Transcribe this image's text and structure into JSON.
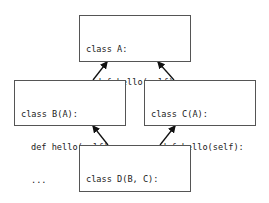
{
  "diagram": {
    "type": "class-inheritance",
    "colors": {
      "border": "#555555",
      "text": "#222222",
      "arrow": "#111111",
      "background": "#ffffff"
    },
    "nodes": [
      {
        "id": "A",
        "header": "class A:",
        "method": "def hello(self):",
        "body": "..."
      },
      {
        "id": "B",
        "header": "class B(A):",
        "method": "def hello(self):",
        "body": "..."
      },
      {
        "id": "C",
        "header": "class C(A):",
        "method": "def hello(self):",
        "body": "..."
      },
      {
        "id": "D",
        "header": "class D(B, C):",
        "method": "def hello(self):",
        "body": "..."
      }
    ],
    "edges": [
      {
        "from": "B",
        "to": "A"
      },
      {
        "from": "C",
        "to": "A"
      },
      {
        "from": "D",
        "to": "B"
      },
      {
        "from": "D",
        "to": "C"
      }
    ]
  }
}
